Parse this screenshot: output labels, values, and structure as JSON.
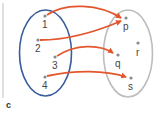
{
  "panel_label": "c",
  "colors": {
    "domain_ellipse": "#3a5c9c",
    "codomain_ellipse": "#bdbdbd",
    "arrow": "#e4572e",
    "point": "#8a8a8a",
    "divider": "#cccccc"
  },
  "domain": {
    "points": [
      {
        "label": "1",
        "x": 45,
        "y": 16
      },
      {
        "label": "2",
        "x": 38,
        "y": 40
      },
      {
        "label": "3",
        "x": 55,
        "y": 57
      },
      {
        "label": "4",
        "x": 45,
        "y": 77
      }
    ]
  },
  "codomain": {
    "points": [
      {
        "label": "p",
        "x": 126,
        "y": 18
      },
      {
        "label": "r",
        "x": 138,
        "y": 43
      },
      {
        "label": "q",
        "x": 118,
        "y": 55
      },
      {
        "label": "s",
        "x": 131,
        "y": 78
      }
    ]
  },
  "mappings": [
    {
      "from": "1",
      "to": "p"
    },
    {
      "from": "2",
      "to": "p"
    },
    {
      "from": "3",
      "to": "q"
    },
    {
      "from": "4",
      "to": "s"
    }
  ]
}
